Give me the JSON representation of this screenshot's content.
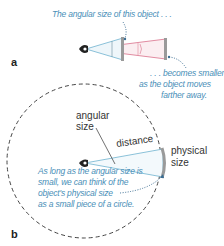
{
  "panel_a": {
    "label": "a",
    "caption_top": "The angular size of this object . . .",
    "caption_bottom": [
      ". . . becomes smaller",
      "as the object moves",
      "farther away."
    ]
  },
  "panel_b": {
    "label": "b",
    "angular_size_label": [
      "angular",
      "size"
    ],
    "distance_label": "distance",
    "physical_size_label": [
      "physical",
      "size"
    ],
    "caption": [
      "As long as the angular size is",
      "small, we can think of the",
      "object's physical size",
      "as a small piece of a circle."
    ]
  },
  "colors": {
    "near_cone": "#6fb3cf",
    "far_cone": "#d9708a",
    "caption": "#4a8fb8",
    "circle": "#444444",
    "object": "#9a9a9a"
  }
}
